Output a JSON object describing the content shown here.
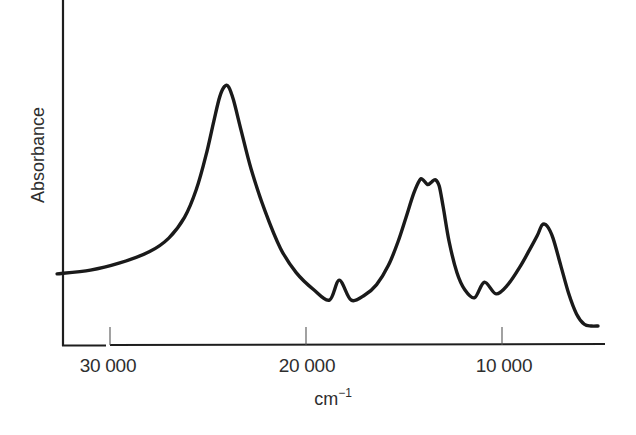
{
  "chart_data": {
    "type": "line",
    "title": "",
    "xlabel": "cm⁻¹",
    "xlabel_base": "cm",
    "xlabel_exponent": "−1",
    "ylabel": "Absorbance",
    "x_reversed": true,
    "xlim": [
      32700,
      5000
    ],
    "ylim": [
      0,
      1
    ],
    "y_ticks_shown": false,
    "grid": false,
    "legend": null,
    "x_ticks": [
      30000,
      20000,
      10000
    ],
    "x_tick_labels": [
      "30 000",
      "20 000",
      "10 000"
    ],
    "series": [
      {
        "name": "Absorption spectrum",
        "color": "#1a1a1a",
        "x": [
          32700,
          31000,
          29500,
          28000,
          27000,
          26200,
          25600,
          25100,
          24700,
          24400,
          24150,
          23950,
          23700,
          23300,
          22800,
          22100,
          21300,
          20500,
          19600,
          18800,
          18300,
          17700,
          17000,
          16400,
          15800,
          15300,
          14900,
          14500,
          14200,
          14050,
          13800,
          13600,
          13400,
          13200,
          13000,
          12700,
          12300,
          11900,
          11400,
          10900,
          10300,
          9700,
          9100,
          8600,
          8200,
          7950,
          7700,
          7400,
          7000,
          6600,
          6200,
          5800,
          5450,
          5100
        ],
        "y": [
          0.206,
          0.217,
          0.238,
          0.27,
          0.31,
          0.37,
          0.45,
          0.55,
          0.65,
          0.72,
          0.75,
          0.748,
          0.71,
          0.62,
          0.51,
          0.39,
          0.28,
          0.21,
          0.16,
          0.13,
          0.188,
          0.13,
          0.145,
          0.175,
          0.23,
          0.3,
          0.37,
          0.44,
          0.478,
          0.48,
          0.465,
          0.472,
          0.479,
          0.46,
          0.4,
          0.3,
          0.21,
          0.16,
          0.137,
          0.182,
          0.148,
          0.175,
          0.225,
          0.275,
          0.317,
          0.348,
          0.345,
          0.31,
          0.23,
          0.15,
          0.09,
          0.06,
          0.055,
          0.055
        ],
        "peaks": [
          {
            "x": 24100,
            "y": 0.754,
            "label": "main band"
          },
          {
            "x": 14100,
            "y": 0.478,
            "label": "doublet component 1"
          },
          {
            "x": 13400,
            "y": 0.478,
            "label": "doublet component 2"
          },
          {
            "x": 8000,
            "y": 0.348,
            "label": "low-energy band"
          }
        ],
        "minima": [
          {
            "x": 18300,
            "y": 0.188
          },
          {
            "x": 10900,
            "y": 0.182
          }
        ]
      }
    ]
  },
  "axes": {
    "y_title": "Absorbance",
    "x_title_base": "cm",
    "x_title_exp": "−1",
    "x_tick_labels": [
      "30 000",
      "20 000",
      "10 000"
    ]
  }
}
